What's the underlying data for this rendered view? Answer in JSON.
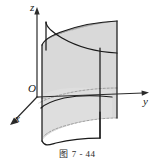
{
  "figure": {
    "caption": "图 7 - 44",
    "caption_number": "7 - 44",
    "background_color": "#ffffff",
    "stroke_color": "#1a1a1a"
  },
  "axes": {
    "origin_label": "O",
    "z_label": "z",
    "y_label": "y",
    "x_label": "x",
    "axis_color": "#2b2b2b"
  },
  "surface": {
    "name": "parabolic-cylinder",
    "front_fill": "#d9d9d9",
    "side_fill": "#9b9b9b",
    "top_fill": "#a3a3a3",
    "inner_fill": "#bdbdbd",
    "dashed_color": "#8a8a8a"
  }
}
